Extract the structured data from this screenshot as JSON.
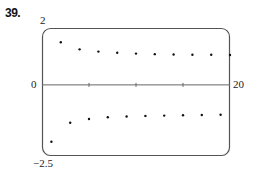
{
  "problem_label": "39.",
  "chart_data": {
    "type": "scatter",
    "title": "",
    "xlabel": "",
    "ylabel": "",
    "xlim": [
      0,
      20
    ],
    "ylim": [
      -2.5,
      2
    ],
    "grid": false,
    "legend": null,
    "axis_labels": {
      "y_top": "2",
      "y_bottom": "−2.5",
      "x_left": "0",
      "x_right": "20"
    },
    "x_ticks": [
      5,
      10,
      15
    ],
    "series": [
      {
        "name": "a_n",
        "x": [
          1,
          2,
          3,
          4,
          5,
          6,
          7,
          8,
          9,
          10,
          11,
          12,
          13,
          14,
          15,
          16,
          17,
          18,
          19,
          20
        ],
        "values": [
          -2.0,
          1.5,
          -1.33,
          1.25,
          -1.2,
          1.17,
          -1.14,
          1.13,
          -1.11,
          1.1,
          -1.09,
          1.08,
          -1.08,
          1.07,
          -1.07,
          1.06,
          -1.06,
          1.06,
          -1.05,
          1.05
        ]
      }
    ]
  },
  "colors": {
    "frame": "#555555",
    "axis": "#666666",
    "point": "#111111",
    "background": "#ffffff"
  }
}
